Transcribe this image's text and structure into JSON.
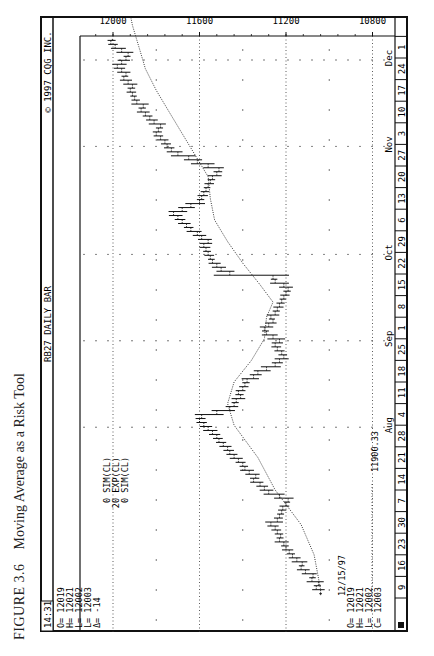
{
  "caption": {
    "figure": "FIGURE 3.6",
    "title": "Moving Average as a Risk Tool"
  },
  "header": {
    "time": "14:31",
    "symbol_title": "RB27 DAILY BAR",
    "copyright": "© 1997 CQG INC."
  },
  "quote_box": {
    "lines": [
      "O= 12019",
      "H= 12021",
      "L= 12002",
      "L= 12003",
      "Δ=   -14"
    ]
  },
  "study_legend": {
    "lines": [
      "0 SIM(CL)",
      "20 EXP(CL)",
      "0 SIM(CL)"
    ]
  },
  "ma_value": "11900.33",
  "last_bar": {
    "date": "12/15/97",
    "lines": [
      "O= 12019",
      "H= 12021",
      "L= 12002",
      "C= 12003"
    ]
  },
  "chart_data": {
    "type": "bar",
    "title": "RB27 DAILY BAR",
    "subtitle": "Moving Average as a Risk Tool",
    "xlabel": "Date (1997)",
    "ylabel": "Price",
    "ylim": [
      10700,
      12100
    ],
    "y_ticks": [
      12000,
      11600,
      11200,
      10800
    ],
    "grid": true,
    "months": [
      {
        "label": "Aug",
        "week_index": 8
      },
      {
        "label": "Sep",
        "week_index": 12
      },
      {
        "label": "Oct",
        "week_index": 16
      },
      {
        "label": "Nov",
        "week_index": 21
      },
      {
        "label": "Dec",
        "week_index": 25
      }
    ],
    "week_labels": [
      "9",
      "16",
      "23",
      "30",
      "7",
      "14",
      "21",
      "28",
      "4",
      "11",
      "18",
      "25",
      "1",
      "8",
      "15",
      "22",
      "29",
      "6",
      "13",
      "20",
      "27",
      "3",
      "10",
      "17",
      "24",
      "1",
      "8",
      "15"
    ],
    "series": [
      {
        "name": "Daily Bar (approx. close)",
        "kind": "ohlc",
        "closes": [
          11040,
          11060,
          11050,
          11080,
          11075,
          11110,
          11130,
          11125,
          11150,
          11170,
          11185,
          11200,
          11210,
          11230,
          11225,
          11240,
          11250,
          11270,
          11240,
          11230,
          11220,
          11215,
          11200,
          11190,
          11230,
          11280,
          11300,
          11320,
          11350,
          11340,
          11370,
          11390,
          11400,
          11420,
          11440,
          11460,
          11470,
          11490,
          11510,
          11520,
          11540,
          11560,
          11580,
          11600,
          11590,
          11520,
          11460,
          11440,
          11430,
          11410,
          11420,
          11400,
          11390,
          11380,
          11350,
          11330,
          11290,
          11250,
          11230,
          11210,
          11220,
          11240,
          11250,
          11230,
          11260,
          11290,
          11300,
          11280,
          11260,
          11270,
          11250,
          11240,
          11230,
          11220,
          11210,
          11200,
          11190,
          11210,
          11250,
          11260,
          11460,
          11500,
          11520,
          11540,
          11550,
          11560,
          11570,
          11580,
          11560,
          11590,
          11610,
          11640,
          11660,
          11680,
          11700,
          11720,
          11680,
          11640,
          11600,
          11590,
          11580,
          11570,
          11560,
          11550,
          11540,
          11520,
          11510,
          11560,
          11610,
          11650,
          11700,
          11730,
          11750,
          11760,
          11780,
          11800,
          11790,
          11780,
          11810,
          11830,
          11850,
          11870,
          11860,
          11890,
          11900,
          11910,
          11920,
          11910,
          11930,
          11950,
          11940,
          11960,
          11980,
          11960,
          11940,
          11930,
          11960,
          11990,
          12010,
          12003
        ]
      },
      {
        "name": "20 EXP(CL) moving average",
        "kind": "line",
        "points_week_price": [
          [
            0.4,
            11040
          ],
          [
            2,
            11070
          ],
          [
            3.4,
            11130
          ],
          [
            5,
            11250
          ],
          [
            6.5,
            11330
          ],
          [
            8,
            11440
          ],
          [
            9,
            11470
          ],
          [
            10,
            11440
          ],
          [
            11,
            11360
          ],
          [
            12,
            11300
          ],
          [
            13,
            11290
          ],
          [
            13.7,
            11260
          ],
          [
            14.5,
            11320
          ],
          [
            15.5,
            11400
          ],
          [
            16.5,
            11470
          ],
          [
            17.5,
            11530
          ],
          [
            18.5,
            11550
          ],
          [
            19.5,
            11560
          ],
          [
            20.5,
            11620
          ],
          [
            21.5,
            11680
          ],
          [
            22.5,
            11740
          ],
          [
            23.5,
            11800
          ],
          [
            24.5,
            11850
          ],
          [
            25.5,
            11880
          ],
          [
            26.5,
            11910
          ],
          [
            27,
            11920
          ]
        ]
      }
    ],
    "annotations": [
      "11900.33",
      "12/15/97"
    ]
  }
}
